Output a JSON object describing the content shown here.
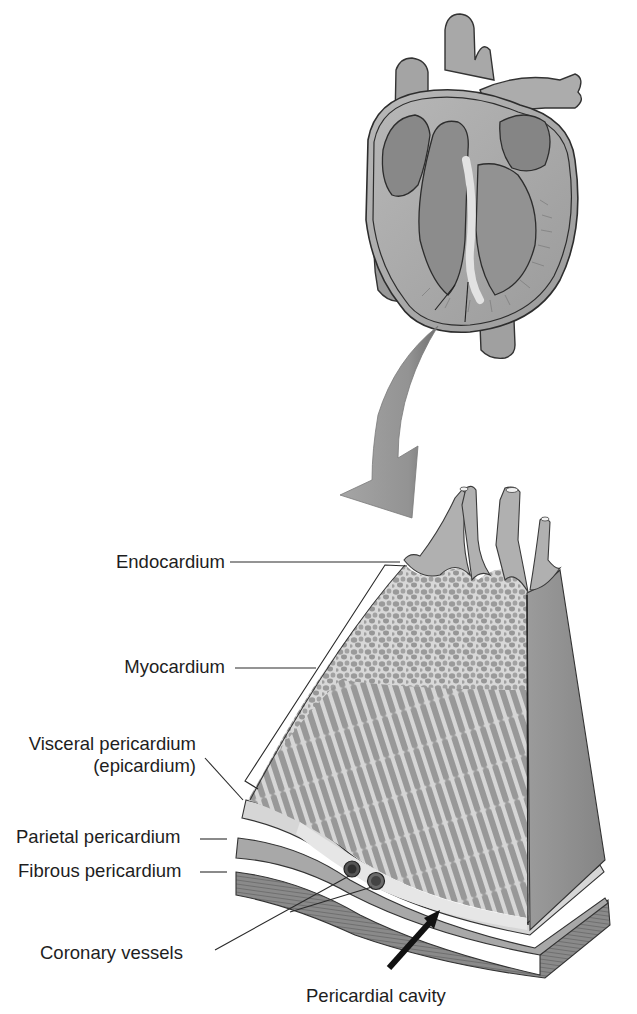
{
  "figure": {
    "style": "grayscale textbook illustration",
    "colors": {
      "background": "#ffffff",
      "text": "#1e1e1e",
      "leader_lines": "#2a2a2a",
      "heart_fill": "#a9a9a9",
      "heart_dark": "#7d7d7d",
      "arrow_fill": "#9a9a9a",
      "muscle_fill": "#9c9c9c",
      "connective_light": "#dcdcdc",
      "side_face": "#8f8f8f",
      "base_layer": "#7a7a7a",
      "pointer_arrow": "#111111"
    }
  },
  "labels": {
    "endocardium": "Endocardium",
    "myocardium": "Myocardium",
    "visceral_line1": "Visceral pericardium",
    "visceral_line2": "(epicardium)",
    "parietal": "Parietal pericardium",
    "fibrous": "Fibrous pericardium",
    "coronary": "Coronary vessels",
    "cavity": "Pericardial cavity"
  },
  "illustrations": {
    "top": "heart-cross-section",
    "middle": "curved-zoom-arrow",
    "bottom": "heart-wall-tissue-block"
  }
}
